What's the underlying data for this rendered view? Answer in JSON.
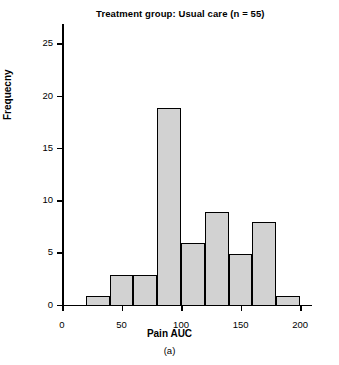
{
  "chart_data": {
    "type": "bar",
    "title": "Treatment group: Usual care (n = 55)",
    "xlabel": "Pain AUC",
    "ylabel": "Frequecny",
    "panel_label": "(a)",
    "grid": false,
    "legend": null,
    "bin_width": 20,
    "bin_starts": [
      20,
      40,
      60,
      80,
      100,
      120,
      140,
      160,
      180
    ],
    "categories": [
      "20-40",
      "40-60",
      "60-80",
      "80-100",
      "100-120",
      "120-140",
      "140-160",
      "160-180",
      "180-200"
    ],
    "values": [
      1,
      3,
      3,
      19,
      6,
      9,
      5,
      8,
      1
    ],
    "xlim": [
      0,
      210
    ],
    "ylim": [
      0,
      27
    ],
    "xticks": [
      0,
      50,
      100,
      150,
      200
    ],
    "xtick_labels": [
      "0",
      "50",
      "100",
      "150",
      "200"
    ],
    "yticks": [
      0,
      5,
      10,
      15,
      20,
      25
    ],
    "ytick_labels": [
      "0",
      "5",
      "10",
      "15",
      "20",
      "25"
    ],
    "bar_color": "#d2d2d2",
    "bar_edge_color": "#000000"
  }
}
